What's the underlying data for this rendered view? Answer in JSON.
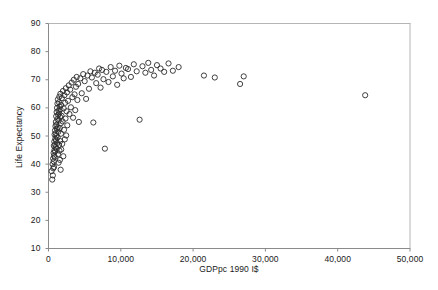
{
  "chart_data": {
    "type": "scatter",
    "title": "",
    "xlabel": "GDPpc 1990 I$",
    "ylabel": "Life Expectancy",
    "xlim": [
      0,
      50000
    ],
    "ylim": [
      10,
      90
    ],
    "xticks": [
      0,
      10000,
      20000,
      30000,
      40000,
      50000
    ],
    "xtick_labels": [
      "0",
      "10,000",
      "20,000",
      "30,000",
      "40,000",
      "50,000"
    ],
    "yticks": [
      10,
      20,
      30,
      40,
      50,
      60,
      70,
      80,
      90
    ],
    "ytick_labels": [
      "10",
      "20",
      "30",
      "40",
      "50",
      "60",
      "70",
      "80",
      "90"
    ],
    "grid": false,
    "legend": null,
    "marker": {
      "shape": "open-circle",
      "radius_px": 2.6,
      "stroke": "#2b2b2b",
      "fill": "none",
      "stroke_width": 0.9
    },
    "axis_color": "#8a8a8a",
    "series": [
      {
        "name": "Countries",
        "points": [
          [
            420,
            37.5
          ],
          [
            520,
            34.5
          ],
          [
            560,
            40.0
          ],
          [
            600,
            36.0
          ],
          [
            640,
            42.0
          ],
          [
            660,
            38.5
          ],
          [
            700,
            44.0
          ],
          [
            720,
            41.0
          ],
          [
            740,
            46.5
          ],
          [
            760,
            39.0
          ],
          [
            780,
            43.0
          ],
          [
            800,
            48.0
          ],
          [
            820,
            45.0
          ],
          [
            840,
            50.5
          ],
          [
            860,
            42.5
          ],
          [
            880,
            47.0
          ],
          [
            900,
            52.0
          ],
          [
            920,
            44.5
          ],
          [
            940,
            49.0
          ],
          [
            960,
            53.5
          ],
          [
            980,
            46.0
          ],
          [
            1000,
            51.0
          ],
          [
            1020,
            55.0
          ],
          [
            1040,
            48.5
          ],
          [
            1060,
            57.0
          ],
          [
            1080,
            50.0
          ],
          [
            1100,
            54.0
          ],
          [
            1120,
            58.5
          ],
          [
            1140,
            45.5
          ],
          [
            1160,
            52.5
          ],
          [
            1180,
            60.0
          ],
          [
            1200,
            47.5
          ],
          [
            1220,
            56.0
          ],
          [
            1240,
            61.5
          ],
          [
            1260,
            49.5
          ],
          [
            1280,
            53.0
          ],
          [
            1300,
            63.0
          ],
          [
            1320,
            43.5
          ],
          [
            1340,
            57.5
          ],
          [
            1360,
            51.5
          ],
          [
            1380,
            59.0
          ],
          [
            1400,
            40.5
          ],
          [
            1420,
            55.5
          ],
          [
            1440,
            62.0
          ],
          [
            1460,
            46.8
          ],
          [
            1480,
            58.0
          ],
          [
            1500,
            64.0
          ],
          [
            1520,
            44.8
          ],
          [
            1540,
            60.5
          ],
          [
            1560,
            52.8
          ],
          [
            1580,
            41.5
          ],
          [
            1600,
            56.8
          ],
          [
            1620,
            48.2
          ],
          [
            1640,
            65.0
          ],
          [
            1660,
            59.5
          ],
          [
            1680,
            38.0
          ],
          [
            1700,
            54.5
          ],
          [
            1720,
            50.8
          ],
          [
            1740,
            61.0
          ],
          [
            1760,
            45.2
          ],
          [
            1800,
            57.2
          ],
          [
            1850,
            63.5
          ],
          [
            1900,
            47.2
          ],
          [
            1950,
            55.2
          ],
          [
            2000,
            66.0
          ],
          [
            2050,
            42.8
          ],
          [
            2100,
            59.8
          ],
          [
            2150,
            52.2
          ],
          [
            2200,
            64.5
          ],
          [
            2250,
            48.8
          ],
          [
            2300,
            61.8
          ],
          [
            2350,
            56.2
          ],
          [
            2400,
            67.0
          ],
          [
            2450,
            50.2
          ],
          [
            2500,
            58.8
          ],
          [
            2550,
            65.5
          ],
          [
            2600,
            53.8
          ],
          [
            2700,
            62.5
          ],
          [
            2800,
            68.0
          ],
          [
            2900,
            57.8
          ],
          [
            3000,
            66.5
          ],
          [
            3100,
            60.2
          ],
          [
            3200,
            69.0
          ],
          [
            3300,
            63.8
          ],
          [
            3400,
            56.5
          ],
          [
            3500,
            70.0
          ],
          [
            3600,
            64.8
          ],
          [
            3700,
            59.2
          ],
          [
            3800,
            67.5
          ],
          [
            3900,
            71.0
          ],
          [
            4000,
            62.8
          ],
          [
            4100,
            68.5
          ],
          [
            4200,
            55.0
          ],
          [
            4400,
            70.5
          ],
          [
            4600,
            65.2
          ],
          [
            4800,
            72.0
          ],
          [
            5000,
            69.5
          ],
          [
            5200,
            63.2
          ],
          [
            5400,
            71.5
          ],
          [
            5600,
            66.8
          ],
          [
            5800,
            73.0
          ],
          [
            6000,
            70.8
          ],
          [
            6200,
            54.8
          ],
          [
            6400,
            72.5
          ],
          [
            6600,
            68.8
          ],
          [
            6800,
            71.8
          ],
          [
            7000,
            74.0
          ],
          [
            7200,
            67.2
          ],
          [
            7400,
            73.5
          ],
          [
            7600,
            70.2
          ],
          [
            7800,
            45.5
          ],
          [
            8000,
            72.8
          ],
          [
            8300,
            69.2
          ],
          [
            8600,
            74.5
          ],
          [
            8900,
            71.2
          ],
          [
            9200,
            73.2
          ],
          [
            9500,
            68.2
          ],
          [
            9800,
            75.0
          ],
          [
            10100,
            72.2
          ],
          [
            10400,
            70.5
          ],
          [
            10700,
            74.2
          ],
          [
            11000,
            73.8
          ],
          [
            11400,
            71.0
          ],
          [
            11800,
            75.5
          ],
          [
            12200,
            73.0
          ],
          [
            12600,
            55.8
          ],
          [
            13000,
            74.8
          ],
          [
            13400,
            72.5
          ],
          [
            13800,
            76.0
          ],
          [
            14200,
            73.5
          ],
          [
            14600,
            71.5
          ],
          [
            15000,
            75.2
          ],
          [
            15500,
            74.0
          ],
          [
            16000,
            72.8
          ],
          [
            16600,
            75.8
          ],
          [
            17200,
            73.2
          ],
          [
            18000,
            74.5
          ],
          [
            21500,
            71.5
          ],
          [
            23000,
            70.8
          ],
          [
            26500,
            68.5
          ],
          [
            27000,
            71.2
          ],
          [
            43800,
            64.5
          ]
        ]
      }
    ]
  },
  "axes": {
    "x_title": "GDPpc 1990 I$",
    "y_title": "Life Expectancy"
  }
}
